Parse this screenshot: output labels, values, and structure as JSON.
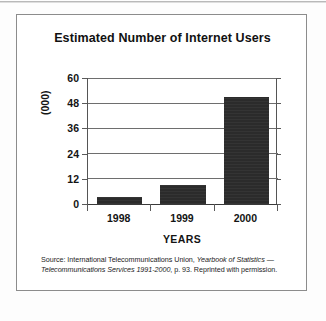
{
  "figure": {
    "title": "Estimated Number of Internet Users",
    "source_note": {
      "prefix": "Source: International Telecommunications Union, ",
      "italic_1": "Yearbook of Statistics",
      "middle": " ",
      "italic_2": "— Telecommunications Services 1991-2000",
      "suffix": ", p. 93. Reprinted with permission."
    }
  },
  "chart_data": {
    "type": "bar",
    "title": "Estimated Number of Internet Users",
    "categories": [
      "1998",
      "1999",
      "2000"
    ],
    "values": [
      3.5,
      9,
      51
    ],
    "xlabel": "YEARS",
    "ylabel": "(000)",
    "ylim": [
      0,
      60
    ],
    "yticks": [
      0,
      12,
      24,
      36,
      48,
      60
    ],
    "ytick_labels": [
      "0",
      "12",
      "24",
      "36",
      "48",
      "60"
    ],
    "grid": true,
    "legend": false,
    "bar_color": "#2b2b2b",
    "axis_color": "#3a3a3a"
  }
}
